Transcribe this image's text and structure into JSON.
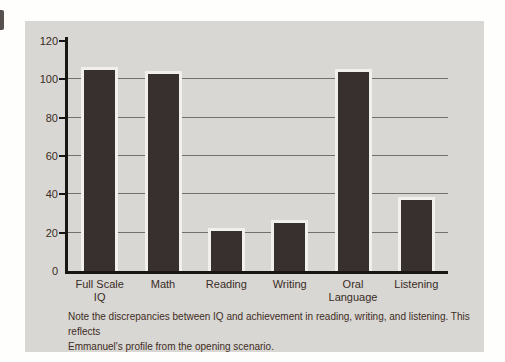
{
  "figure": {
    "panel_color": "#d8d7d4",
    "note_lines": [
      "Note the discrepancies between IQ and achievement in reading, writing, and listening. This reflects",
      "Emmanuel's profile from the opening scenario."
    ]
  },
  "chart_data": {
    "type": "bar",
    "categories": [
      "Full Scale\nIQ",
      "Math",
      "Reading",
      "Writing",
      "Oral\nLanguage",
      "Listening"
    ],
    "values": [
      105,
      103,
      21,
      25,
      104,
      37
    ],
    "title": "",
    "xlabel": "",
    "ylabel": "",
    "ylim": [
      0,
      120
    ],
    "yticks": [
      0,
      20,
      40,
      60,
      80,
      100,
      120
    ],
    "gridline_values": [
      20,
      40,
      60,
      80,
      100
    ],
    "grid": true,
    "legend": false,
    "bar_color": "#382f2f",
    "bar_outline_color": "#f1f0ee",
    "axis_color": "#181514",
    "gridline_color": "#73716e",
    "text_color": "#3a2c24",
    "plot_background": "#d8d7d4"
  }
}
